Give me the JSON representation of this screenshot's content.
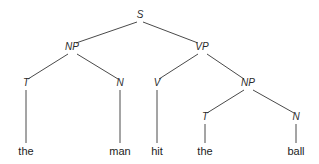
{
  "diagram": {
    "type": "syntax-tree",
    "sentence": "the man hit the ball",
    "canvas": {
      "width": 319,
      "height": 164,
      "background": "#ffffff"
    },
    "style": {
      "edge_color": "#4a4a4a",
      "node_text_color": "#2b2b2b",
      "leaf_text_color": "#1c1c1c",
      "node_font_style": "italic",
      "leaf_font_style": "normal"
    },
    "nodes": [
      {
        "id": "s",
        "label": "S",
        "x": 140,
        "y": 18,
        "level": 0
      },
      {
        "id": "np1",
        "label": "NP",
        "x": 72,
        "y": 50,
        "level": 1
      },
      {
        "id": "vp",
        "label": "VP",
        "x": 202,
        "y": 50,
        "level": 1
      },
      {
        "id": "t1",
        "label": "T",
        "x": 26,
        "y": 86,
        "level": 2
      },
      {
        "id": "n1",
        "label": "N",
        "x": 120,
        "y": 86,
        "level": 2
      },
      {
        "id": "v",
        "label": "V",
        "x": 157,
        "y": 86,
        "level": 2
      },
      {
        "id": "np2",
        "label": "NP",
        "x": 248,
        "y": 86,
        "level": 2
      },
      {
        "id": "t2",
        "label": "T",
        "x": 205,
        "y": 120,
        "level": 3
      },
      {
        "id": "n2",
        "label": "N",
        "x": 296,
        "y": 120,
        "level": 3
      }
    ],
    "leaves": [
      {
        "id": "w1",
        "label": "the",
        "x": 26,
        "y": 155,
        "parent": "t1"
      },
      {
        "id": "w2",
        "label": "man",
        "x": 120,
        "y": 155,
        "parent": "n1"
      },
      {
        "id": "w3",
        "label": "hit",
        "x": 157,
        "y": 155,
        "parent": "v"
      },
      {
        "id": "w4",
        "label": "the",
        "x": 205,
        "y": 155,
        "parent": "t2"
      },
      {
        "id": "w5",
        "label": "ball",
        "x": 296,
        "y": 155,
        "parent": "n2"
      }
    ],
    "edges": [
      {
        "id": "e1",
        "from": "s",
        "to": "np1",
        "x1": 137,
        "y1": 22,
        "x2": 76,
        "y2": 43
      },
      {
        "id": "e2",
        "from": "s",
        "to": "vp",
        "x1": 143,
        "y1": 22,
        "x2": 198,
        "y2": 43
      },
      {
        "id": "e3",
        "from": "np1",
        "to": "t1",
        "x1": 68,
        "y1": 54,
        "x2": 28,
        "y2": 79
      },
      {
        "id": "e4",
        "from": "np1",
        "to": "n1",
        "x1": 77,
        "y1": 54,
        "x2": 118,
        "y2": 79
      },
      {
        "id": "e5",
        "from": "vp",
        "to": "v",
        "x1": 198,
        "y1": 54,
        "x2": 159,
        "y2": 79
      },
      {
        "id": "e6",
        "from": "vp",
        "to": "np2",
        "x1": 207,
        "y1": 54,
        "x2": 244,
        "y2": 79
      },
      {
        "id": "e7",
        "from": "np2",
        "to": "t2",
        "x1": 244,
        "y1": 90,
        "x2": 207,
        "y2": 113
      },
      {
        "id": "e8",
        "from": "np2",
        "to": "n2",
        "x1": 253,
        "y1": 90,
        "x2": 294,
        "y2": 113
      },
      {
        "id": "e9",
        "from": "t1",
        "to": "w1",
        "x1": 26,
        "y1": 90,
        "x2": 26,
        "y2": 143
      },
      {
        "id": "e10",
        "from": "n1",
        "to": "w2",
        "x1": 120,
        "y1": 90,
        "x2": 120,
        "y2": 143
      },
      {
        "id": "e11",
        "from": "v",
        "to": "w3",
        "x1": 157,
        "y1": 90,
        "x2": 157,
        "y2": 143
      },
      {
        "id": "e12",
        "from": "t2",
        "to": "w4",
        "x1": 205,
        "y1": 124,
        "x2": 205,
        "y2": 143
      },
      {
        "id": "e13",
        "from": "n2",
        "to": "w5",
        "x1": 296,
        "y1": 124,
        "x2": 296,
        "y2": 143
      }
    ]
  }
}
